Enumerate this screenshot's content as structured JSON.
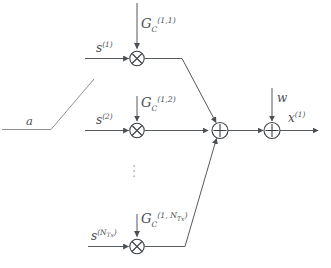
{
  "figure": {
    "type": "signal-flow-block-diagram",
    "background_color": "#ffffff",
    "line_color": "#555a5e",
    "label_color": "#4c5156"
  },
  "branches": [
    {
      "id": "branch-1",
      "input_label": {
        "base": "s",
        "sup": "(1)"
      },
      "gain_label": {
        "base": "G",
        "sub": "C",
        "sup": "(1,1)"
      },
      "operator": "multiply",
      "operator_glyph": "⊗"
    },
    {
      "id": "branch-2",
      "input_label": {
        "base": "s",
        "sup": "(2)"
      },
      "gain_label": {
        "base": "G",
        "sub": "C",
        "sup": "(1,2)"
      },
      "operator": "multiply",
      "operator_glyph": "⊗"
    },
    {
      "id": "branch-n",
      "input_label": {
        "base": "s",
        "sup": "(N",
        "sup_sub": "Tx",
        "sup_close": ")"
      },
      "gain_label": {
        "base": "G",
        "sub": "C",
        "sup": "(1, N",
        "sup_sub": "Tx",
        "sup_close": ")"
      },
      "operator": "multiply",
      "operator_glyph": "⊗"
    }
  ],
  "ellipsis": {
    "glyph": "⋮",
    "meaning": "additional-branches"
  },
  "adders": [
    {
      "id": "sum-junction",
      "glyph": "⊕",
      "operation": "sum-of-branches"
    },
    {
      "id": "noise-adder",
      "glyph": "⊕",
      "operation": "add-noise"
    }
  ],
  "noise": {
    "label": {
      "base": "w"
    }
  },
  "output": {
    "label": {
      "base": "x",
      "sup": "(1)"
    }
  },
  "stray_annotation": {
    "label": {
      "base": "a"
    },
    "note": "label on cropped leading line at left edge"
  },
  "glyphs": {
    "multiply": "⊗",
    "add": "⊕",
    "vertical_ellipsis": "⋮"
  }
}
